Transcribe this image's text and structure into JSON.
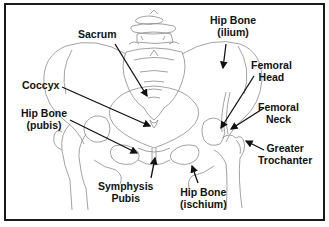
{
  "diagram": {
    "border_color": "#1a1a1a",
    "line_color": "#888888",
    "arrow_color": "#111111",
    "labels": [
      {
        "id": "sacrum",
        "lines": [
          "Sacrum"
        ]
      },
      {
        "id": "hip-bone-ilium",
        "lines": [
          "Hip Bone",
          "(ilium)"
        ]
      },
      {
        "id": "coccyx",
        "lines": [
          "Coccyx"
        ]
      },
      {
        "id": "femoral-head",
        "lines": [
          "Femoral",
          "Head"
        ]
      },
      {
        "id": "femoral-neck",
        "lines": [
          "Femoral",
          "Neck"
        ]
      },
      {
        "id": "hip-bone-pubis",
        "lines": [
          "Hip Bone",
          "(pubis)"
        ]
      },
      {
        "id": "greater-trochanter",
        "lines": [
          "Greater",
          "Trochanter"
        ]
      },
      {
        "id": "symphysis-pubis",
        "lines": [
          "Symphysis",
          "Pubis"
        ]
      },
      {
        "id": "hip-bone-ischium",
        "lines": [
          "Hip Bone",
          "(ischium)"
        ]
      }
    ]
  }
}
